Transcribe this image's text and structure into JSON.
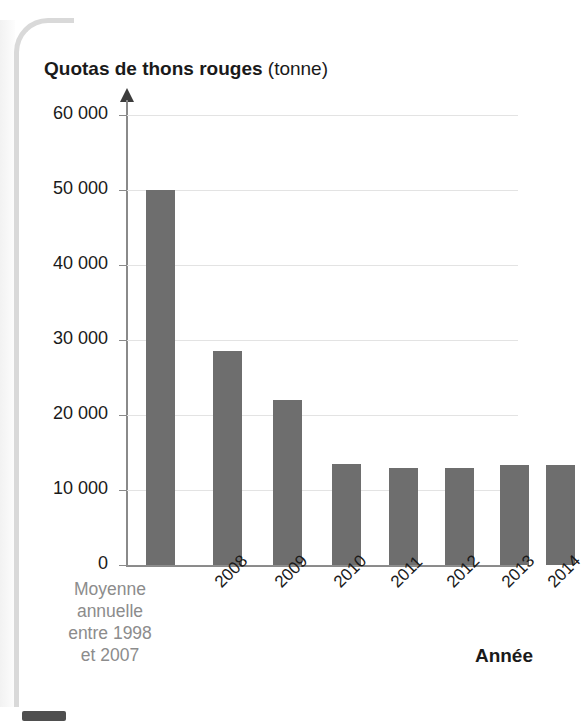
{
  "chart_title": {
    "main": "Quotas de thons rouges",
    "unit": "(tonne)"
  },
  "axis": {
    "x_title": "Année",
    "y_tick_labels": [
      "60 000",
      "50 000",
      "40 000",
      "30 000",
      "20 000",
      "10 000",
      "0"
    ],
    "x_category_multiline": "Moyenne\nannuelle\nentre 1998\net 2007",
    "x_tick_labels": [
      "2008",
      "2009",
      "2010",
      "2011",
      "2012",
      "2013",
      "2014"
    ]
  },
  "colors": {
    "bar": "#6e6e6e",
    "gridline": "#e3e3e3",
    "axis": "#8a8a8a",
    "text": "#1a1a1a",
    "muted_text": "#8c8c8c"
  },
  "chart_data": {
    "type": "bar",
    "title": "Quotas de thons rouges (tonne)",
    "xlabel": "Année",
    "ylabel": "Quotas de thons rouges (tonne)",
    "ylim": [
      0,
      60000
    ],
    "yticks": [
      0,
      10000,
      20000,
      30000,
      40000,
      50000,
      60000
    ],
    "grid": true,
    "legend": false,
    "categories": [
      "Moyenne annuelle entre 1998 et 2007",
      "2008",
      "2009",
      "2010",
      "2011",
      "2012",
      "2013",
      "2014"
    ],
    "values": [
      50000,
      28500,
      22000,
      13500,
      12900,
      12900,
      13400,
      13400
    ]
  }
}
